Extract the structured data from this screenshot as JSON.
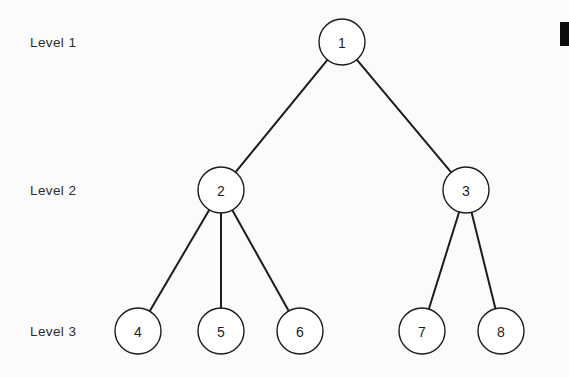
{
  "diagram": {
    "background_color": "#fbfbfc",
    "stroke_color": "#1c1c1c",
    "node_fill_color": "#ffffff",
    "label_color": "#2b2b2b",
    "level_labels": [
      {
        "id": "level-1",
        "text": "Level 1",
        "x": 30,
        "y": 42
      },
      {
        "id": "level-2",
        "text": "Level 2",
        "x": 30,
        "y": 190
      },
      {
        "id": "level-3",
        "text": "Level 3",
        "x": 30,
        "y": 331
      }
    ],
    "nodes": [
      {
        "id": "node-1",
        "label": "1",
        "level": 1,
        "cx": 342,
        "cy": 42,
        "r": 23
      },
      {
        "id": "node-2",
        "label": "2",
        "level": 2,
        "cx": 221,
        "cy": 190,
        "r": 23
      },
      {
        "id": "node-3",
        "label": "3",
        "level": 2,
        "cx": 466,
        "cy": 190,
        "r": 23
      },
      {
        "id": "node-4",
        "label": "4",
        "level": 3,
        "cx": 138,
        "cy": 331,
        "r": 23
      },
      {
        "id": "node-5",
        "label": "5",
        "level": 3,
        "cx": 221,
        "cy": 331,
        "r": 23
      },
      {
        "id": "node-6",
        "label": "6",
        "level": 3,
        "cx": 300,
        "cy": 331,
        "r": 23
      },
      {
        "id": "node-7",
        "label": "7",
        "level": 3,
        "cx": 422,
        "cy": 331,
        "r": 23
      },
      {
        "id": "node-8",
        "label": "8",
        "level": 3,
        "cx": 501,
        "cy": 331,
        "r": 23
      }
    ],
    "edges": [
      {
        "id": "edge-1-2",
        "from": "node-1",
        "to": "node-2"
      },
      {
        "id": "edge-1-3",
        "from": "node-1",
        "to": "node-3"
      },
      {
        "id": "edge-2-4",
        "from": "node-2",
        "to": "node-4"
      },
      {
        "id": "edge-2-5",
        "from": "node-2",
        "to": "node-5"
      },
      {
        "id": "edge-2-6",
        "from": "node-2",
        "to": "node-6"
      },
      {
        "id": "edge-3-7",
        "from": "node-3",
        "to": "node-7"
      },
      {
        "id": "edge-3-8",
        "from": "node-3",
        "to": "node-8"
      }
    ],
    "corner_mark": {
      "id": "corner-mark",
      "x": 560,
      "y": 22,
      "width": 9,
      "height": 24,
      "color": "#0d0d0d"
    }
  }
}
